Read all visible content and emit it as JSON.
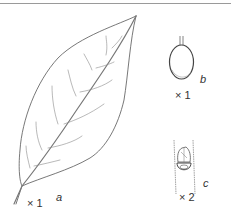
{
  "figure": {
    "panels": [
      {
        "id": "a",
        "subject": "leaf",
        "label": "a",
        "scale": "× 1"
      },
      {
        "id": "b",
        "subject": "fruit",
        "label": "b",
        "scale": "× 1"
      },
      {
        "id": "c",
        "subject": "bud",
        "label": "c",
        "scale": "× 2"
      }
    ],
    "line_color": "#555555",
    "vein_color": "#8a8a8a"
  }
}
